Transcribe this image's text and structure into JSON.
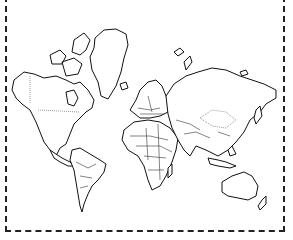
{
  "map": {
    "type": "world-outline",
    "projection": "mercator",
    "style": "black line drawing on white",
    "frame": "dashed border",
    "stroke_color": "#111111",
    "background_color": "#ffffff",
    "regions": [
      "North America",
      "Greenland",
      "South America",
      "Europe",
      "Africa",
      "Asia",
      "Australia",
      "New Zealand"
    ]
  }
}
